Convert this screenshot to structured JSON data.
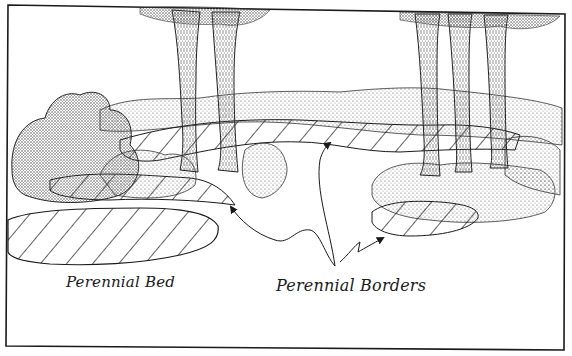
{
  "figure": {
    "labels": {
      "perennial_bed": "Perennial Bed",
      "perennial_borders": "Perennial Borders"
    },
    "callouts": [
      {
        "label": "Perennial Borders",
        "target": "left border strip",
        "arrow_tip": [
          229,
          205
        ]
      },
      {
        "label": "Perennial Borders",
        "target": "central border strip",
        "arrow_tip": [
          330,
          142
        ]
      },
      {
        "label": "Perennial Borders",
        "target": "right border patch",
        "arrow_tip": [
          385,
          237
        ]
      }
    ],
    "elements": {
      "trees": 6,
      "hatched_areas": [
        "perennial bed (lower left)",
        "border strip (middle band)",
        "border patch (right)"
      ]
    },
    "colors": {
      "ink": "#1a1a1a",
      "paper": "#ffffff",
      "stipple": "#6e6e6e"
    }
  }
}
